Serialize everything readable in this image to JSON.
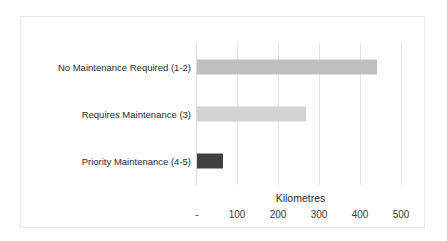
{
  "chart_data": {
    "type": "bar",
    "orientation": "horizontal",
    "title": "",
    "xlabel": "Kilometres",
    "ylabel": "",
    "categories": [
      "No Maintenance Required (1-2)",
      "Requires Maintenance (3)",
      "Priority Maintenance (4-5)"
    ],
    "values": [
      439,
      266,
      63
    ],
    "bar_colors": [
      "#bfbfbf",
      "#d2d2d2",
      "#404040"
    ],
    "xlim": [
      0,
      500
    ],
    "xticks": [
      0,
      100,
      200,
      300,
      400,
      500
    ],
    "xtick_labels": [
      "-",
      "100",
      "200",
      "300",
      "400",
      "500"
    ],
    "grid": "vertical",
    "legend": "none"
  },
  "axis": {
    "title": "Kilometres",
    "ticks": [
      {
        "value": 0,
        "label": "-"
      },
      {
        "value": 100,
        "label": "100"
      },
      {
        "value": 200,
        "label": "200"
      },
      {
        "value": 300,
        "label": "300"
      },
      {
        "value": 400,
        "label": "400"
      },
      {
        "value": 500,
        "label": "500"
      }
    ]
  },
  "bars": [
    {
      "label": "No Maintenance Required (1-2)",
      "value": 439,
      "color": "#bfbfbf"
    },
    {
      "label": "Requires Maintenance (3)",
      "value": 266,
      "color": "#d2d2d2"
    },
    {
      "label": "Priority Maintenance (4-5)",
      "value": 63,
      "color": "#404040"
    }
  ],
  "style": {
    "border_color": "#e8e8e8",
    "gridline_color": "#e4e4e4",
    "background": "#ffffff"
  }
}
